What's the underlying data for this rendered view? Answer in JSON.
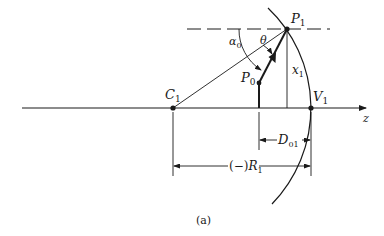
{
  "figure": {
    "caption": "(a)",
    "colors": {
      "ink": "#1a1a1a",
      "background": "#ffffff"
    },
    "labels": {
      "P1": {
        "main": "P",
        "sub": "1"
      },
      "P0": {
        "main": "P",
        "sub": "0"
      },
      "C1": {
        "main": "C",
        "sub": "1"
      },
      "V1": {
        "main": "V",
        "sub": "1"
      },
      "x1": {
        "main": "x",
        "sub": "1"
      },
      "alpha0": {
        "main": "α",
        "sub": "0"
      },
      "theta": {
        "main": "θ"
      },
      "z_axis": {
        "main": "z"
      },
      "D01": {
        "main": "D",
        "sub": "01"
      },
      "R1": {
        "prefix": "(−)",
        "main": "R",
        "sub": "1"
      }
    }
  }
}
